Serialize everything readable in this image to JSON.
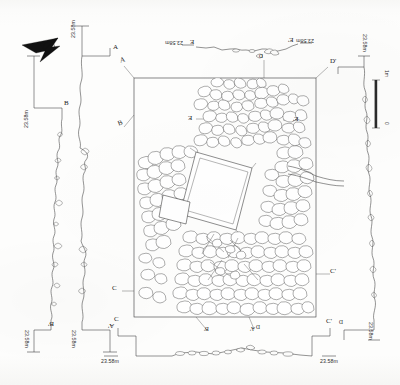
{
  "drawing": {
    "type": "archaeological-site-plan",
    "title_visible": false,
    "ink_color": "#3a3a3a",
    "paper_color": "#fdfdfc"
  },
  "north_arrow": {
    "name": "north-arrow",
    "label": ""
  },
  "scale_bar": {
    "top_label": "1m",
    "bottom_label": "0",
    "units": "m"
  },
  "datum_labels": {
    "value": "23.58m",
    "instances": [
      {
        "id": "datum-a-top",
        "text": "23.58m"
      },
      {
        "id": "datum-b-top",
        "text": "23.58m"
      },
      {
        "id": "datum-e-left",
        "text": "23.58m"
      },
      {
        "id": "datum-e-right",
        "text": "23.58m"
      },
      {
        "id": "datum-d-right",
        "text": "23.58m"
      },
      {
        "id": "datum-b-bottom",
        "text": "23.58m"
      },
      {
        "id": "datum-a-bottom",
        "text": "23.58m"
      },
      {
        "id": "datum-c-bottom-left",
        "text": "23.58m"
      },
      {
        "id": "datum-c-bottom-right",
        "text": "23.58m"
      },
      {
        "id": "datum-d-bottom-right",
        "text": "23.58m"
      }
    ]
  },
  "section_markers": [
    {
      "id": "marker-a",
      "label": "A"
    },
    {
      "id": "marker-a-prime",
      "label": "A'"
    },
    {
      "id": "marker-b",
      "label": "B"
    },
    {
      "id": "marker-b-prime",
      "label": "B'"
    },
    {
      "id": "marker-c",
      "label": "C"
    },
    {
      "id": "marker-c-prime",
      "label": "C'"
    },
    {
      "id": "marker-d",
      "label": "D"
    },
    {
      "id": "marker-d-prime",
      "label": "D'"
    },
    {
      "id": "marker-e",
      "label": "E"
    },
    {
      "id": "marker-e-prime",
      "label": "E'"
    }
  ],
  "plan": {
    "name": "main-plan-view",
    "frame_label": "",
    "section_line_labels": {
      "a_top": "A",
      "b_left": "B",
      "c_left": "C",
      "c_right": "C'",
      "d_top_right": "D'",
      "e_left": "E",
      "e_right": "E'",
      "b_bottom": "B'",
      "a_bottom": "A'",
      "d_bottom": "D"
    }
  },
  "sections": [
    {
      "id": "section-e",
      "name": "section-e-e-prime",
      "start": "E",
      "end": "E'",
      "datum": "23.58m",
      "orientation": "horizontal",
      "position": "top"
    },
    {
      "id": "section-a",
      "name": "section-a-a-prime",
      "start": "A",
      "end": "A'",
      "datum": "23.58m",
      "orientation": "vertical",
      "position": "left-inner"
    },
    {
      "id": "section-b",
      "name": "section-b-b-prime",
      "start": "B",
      "end": "B'",
      "datum": "23.58m",
      "orientation": "vertical",
      "position": "left-outer"
    },
    {
      "id": "section-c",
      "name": "section-c-c-prime",
      "start": "C",
      "end": "C'",
      "datum": "23.58m",
      "orientation": "horizontal",
      "position": "bottom"
    },
    {
      "id": "section-d",
      "name": "section-d-d-prime",
      "start": "D",
      "end": "D'",
      "datum": "23.58m",
      "orientation": "vertical",
      "position": "right"
    }
  ]
}
